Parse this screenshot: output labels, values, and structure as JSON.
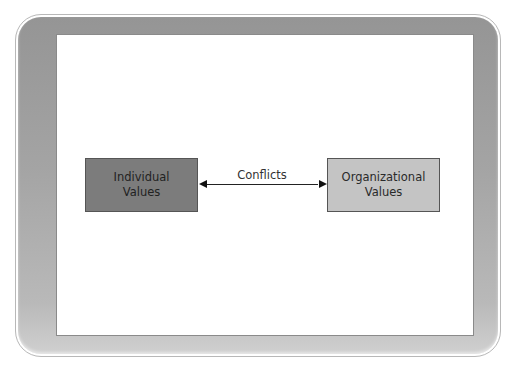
{
  "diagram": {
    "nodes": [
      {
        "id": "individual",
        "label_line1": "Individual",
        "label_line2": "Values",
        "fill": "#7c7c7c"
      },
      {
        "id": "organizational",
        "label_line1": "Organizational",
        "label_line2": "Values",
        "fill": "#c4c4c4"
      }
    ],
    "edge": {
      "from": "individual",
      "to": "organizational",
      "label": "Conflicts",
      "direction": "bidirectional"
    }
  }
}
